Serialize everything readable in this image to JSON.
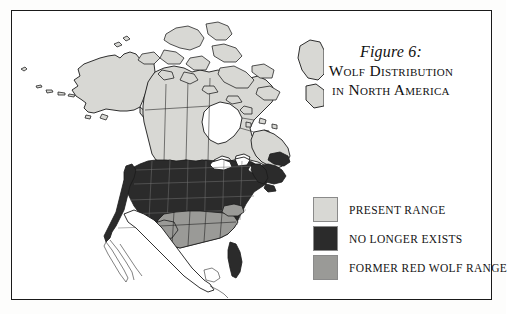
{
  "figure": {
    "number_label": "Figure 6:",
    "title_line1": "Wolf Distribution",
    "title_line2": "in North America"
  },
  "legend": {
    "items": [
      {
        "label": "Present Range",
        "color": "#d8d8d4",
        "swatch_name": "present-range"
      },
      {
        "label": "No Longer Exists",
        "color": "#2b2b2b",
        "swatch_name": "no-longer-exists"
      },
      {
        "label": "Former Red Wolf Range",
        "color": "#9a9a97",
        "swatch_name": "former-red-wolf-range"
      }
    ]
  },
  "map": {
    "title": "North America wolf distribution map",
    "regions": [
      {
        "name": "alaska",
        "shading": "present-range"
      },
      {
        "name": "canada",
        "shading": "present-range"
      },
      {
        "name": "arctic-islands",
        "shading": "present-range"
      },
      {
        "name": "greenland-edge",
        "shading": "present-range"
      },
      {
        "name": "contiguous-us",
        "shading": "no-longer-exists"
      },
      {
        "name": "maritimes",
        "shading": "no-longer-exists"
      },
      {
        "name": "southeast-us",
        "shading": "former-red-wolf-range"
      },
      {
        "name": "mexico",
        "shading": "unshaded"
      }
    ]
  },
  "colors": {
    "present_range": "#d8d8d4",
    "no_longer_exists": "#2b2b2b",
    "former_red_wolf_range": "#9a9a97",
    "unshaded": "#ffffff",
    "outline": "#1a1a1a",
    "frame": "#1a1a1a",
    "page_background": "#ffffff"
  }
}
